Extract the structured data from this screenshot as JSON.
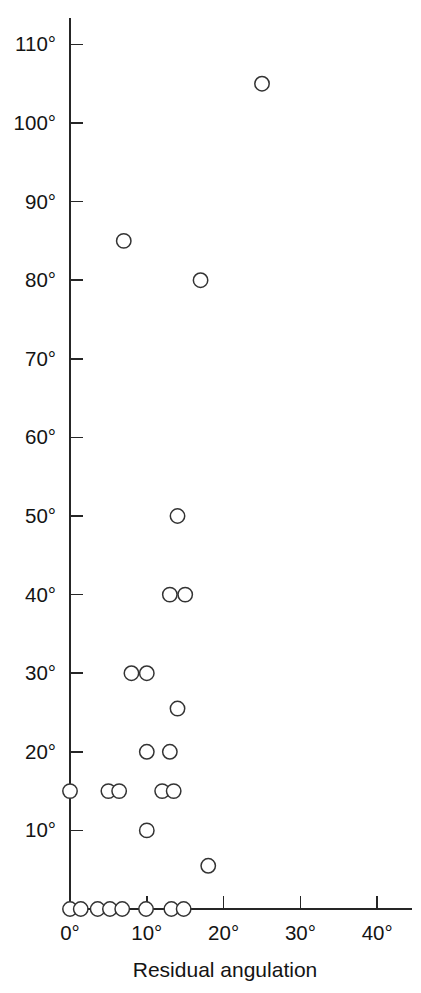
{
  "figure": {
    "clipped_top_text": "",
    "background_color": "#ffffff",
    "marker_color": "#333333",
    "axis_color": "#262626"
  },
  "axes": {
    "x": {
      "label": "Residual angulation",
      "tick_labels": [
        "0°",
        "10°",
        "20°",
        "30°",
        "40°"
      ],
      "tick_values": [
        0,
        10,
        20,
        30,
        40
      ],
      "range": [
        0,
        45
      ]
    },
    "y": {
      "label": "",
      "tick_labels": [
        "10°",
        "20°",
        "30°",
        "40°",
        "50°",
        "60°",
        "70°",
        "80°",
        "90°",
        "100°",
        "110°"
      ],
      "tick_values": [
        10,
        20,
        30,
        40,
        50,
        60,
        70,
        80,
        90,
        100,
        110
      ],
      "range": [
        0,
        115
      ]
    }
  },
  "chart_data": {
    "type": "scatter",
    "title": "",
    "subtitle": "",
    "xlabel": "Residual angulation",
    "ylabel": "",
    "xlim": [
      0,
      45
    ],
    "ylim": [
      0,
      115
    ],
    "grid": false,
    "legend": null,
    "x_unit": "degrees",
    "y_unit": "degrees",
    "marker": "open-circle",
    "n_points": 26,
    "points": [
      {
        "x": 25.0,
        "y": 105.0
      },
      {
        "x": 7.0,
        "y": 85.0
      },
      {
        "x": 17.0,
        "y": 80.0
      },
      {
        "x": 14.0,
        "y": 50.0
      },
      {
        "x": 13.0,
        "y": 40.0
      },
      {
        "x": 15.0,
        "y": 40.0
      },
      {
        "x": 14.0,
        "y": 25.5
      },
      {
        "x": 8.0,
        "y": 30.0
      },
      {
        "x": 10.0,
        "y": 30.0
      },
      {
        "x": 10.0,
        "y": 20.0
      },
      {
        "x": 13.0,
        "y": 20.0
      },
      {
        "x": 0.0,
        "y": 15.0
      },
      {
        "x": 5.0,
        "y": 15.0
      },
      {
        "x": 6.4,
        "y": 15.0
      },
      {
        "x": 12.0,
        "y": 15.0
      },
      {
        "x": 13.5,
        "y": 15.0
      },
      {
        "x": 10.0,
        "y": 10.0
      },
      {
        "x": 18.0,
        "y": 5.5
      },
      {
        "x": 0.0,
        "y": 0.0
      },
      {
        "x": 1.4,
        "y": 0.0
      },
      {
        "x": 3.6,
        "y": 0.0
      },
      {
        "x": 5.2,
        "y": 0.0
      },
      {
        "x": 6.8,
        "y": 0.0
      },
      {
        "x": 9.9,
        "y": 0.0
      },
      {
        "x": 13.2,
        "y": 0.0
      },
      {
        "x": 14.8,
        "y": 0.0
      }
    ]
  }
}
